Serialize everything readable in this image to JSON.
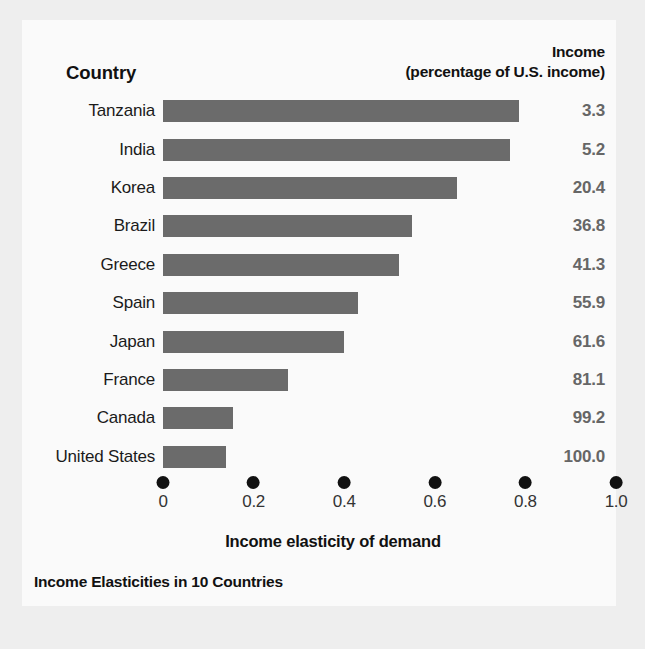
{
  "panel": {
    "background_color": "#fafafa",
    "page_background_color": "#eeeeee"
  },
  "header": {
    "country_label": "Country",
    "income_line1": "Income",
    "income_line2": "(percentage of U.S. income)"
  },
  "axis": {
    "title": "Income elasticity of demand",
    "ticks": [
      "0",
      "0.2",
      "0.4",
      "0.6",
      "0.8",
      "1.0"
    ],
    "tick_values": [
      0,
      0.2,
      0.4,
      0.6,
      0.8,
      1.0
    ],
    "min": 0,
    "max": 1.0,
    "tick_marker": "filled-dot"
  },
  "caption": "Income Elasticities in 10 Countries",
  "colors": {
    "bar": "#6b6b6b",
    "income_value_text": "#666666",
    "label_text": "#1a1a1a",
    "tick_dot": "#111111"
  },
  "chart_data": {
    "type": "bar",
    "orientation": "horizontal",
    "title": "Income Elasticities in 10 Countries",
    "xlabel": "Income elasticity of demand",
    "ylabel": "Country",
    "xlim": [
      0,
      1.0
    ],
    "xticks": [
      0,
      0.2,
      0.4,
      0.6,
      0.8,
      1.0
    ],
    "grid": false,
    "legend": "none",
    "categories": [
      "Tanzania",
      "India",
      "Korea",
      "Brazil",
      "Greece",
      "Spain",
      "Japan",
      "France",
      "Canada",
      "United States"
    ],
    "values": [
      0.785,
      0.765,
      0.65,
      0.55,
      0.52,
      0.43,
      0.4,
      0.275,
      0.155,
      0.14
    ],
    "series": [
      {
        "name": "Income elasticity of demand",
        "values": [
          0.785,
          0.765,
          0.65,
          0.55,
          0.52,
          0.43,
          0.4,
          0.275,
          0.155,
          0.14
        ]
      },
      {
        "name": "Income (percentage of U.S. income)",
        "display_only": true,
        "values": [
          3.3,
          5.2,
          20.4,
          36.8,
          41.3,
          55.9,
          61.6,
          81.1,
          99.2,
          100.0
        ]
      }
    ],
    "rows": [
      {
        "country": "Tanzania",
        "elasticity": 0.785,
        "income": "3.3"
      },
      {
        "country": "India",
        "elasticity": 0.765,
        "income": "5.2"
      },
      {
        "country": "Korea",
        "elasticity": 0.65,
        "income": "20.4"
      },
      {
        "country": "Brazil",
        "elasticity": 0.55,
        "income": "36.8"
      },
      {
        "country": "Greece",
        "elasticity": 0.52,
        "income": "41.3"
      },
      {
        "country": "Spain",
        "elasticity": 0.43,
        "income": "55.9"
      },
      {
        "country": "Japan",
        "elasticity": 0.4,
        "income": "61.6"
      },
      {
        "country": "France",
        "elasticity": 0.275,
        "income": "81.1"
      },
      {
        "country": "Canada",
        "elasticity": 0.155,
        "income": "99.2"
      },
      {
        "country": "United States",
        "elasticity": 0.14,
        "income": "100.0"
      }
    ]
  }
}
